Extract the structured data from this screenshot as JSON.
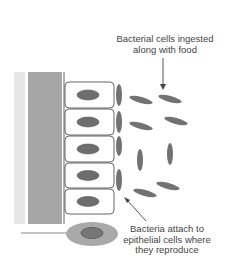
{
  "diagram": {
    "colors": {
      "background": "#ffffff",
      "lumen_strip_light": "#e6e6e6",
      "tissue_strip_dark": "#a6a6a6",
      "cell_outline": "#555555",
      "nucleus": "#6e6e6e",
      "bacterium": "#727272",
      "free_cell_body": "#a9a9a9",
      "free_cell_nucleus": "#777777",
      "arrow": "#444444",
      "text": "#444444"
    },
    "annotations": {
      "ingested": {
        "lines": [
          "Bacterial cells ingested",
          "along with food"
        ]
      },
      "attach": {
        "lines": [
          "Bacteria attach to",
          "epithelial cells where",
          "they reproduce"
        ]
      }
    },
    "epithelial_cells": [
      {
        "y": 82,
        "h": 26
      },
      {
        "y": 109,
        "h": 26
      },
      {
        "y": 136,
        "h": 26
      },
      {
        "y": 163,
        "h": 25
      },
      {
        "y": 189,
        "h": 25
      }
    ],
    "attached_bacteria": [
      {
        "cx": 119,
        "cy": 95,
        "rx": 3,
        "ry": 11
      },
      {
        "cx": 119,
        "cy": 122,
        "rx": 3,
        "ry": 11
      },
      {
        "cx": 119,
        "cy": 146,
        "rx": 3,
        "ry": 10
      },
      {
        "cx": 119,
        "cy": 180,
        "rx": 3,
        "ry": 11
      }
    ],
    "free_bacteria": [
      {
        "cx": 141,
        "cy": 100,
        "rx": 12,
        "ry": 3,
        "rot": 15
      },
      {
        "cx": 170,
        "cy": 99,
        "rx": 12,
        "ry": 3,
        "rot": 15
      },
      {
        "cx": 141,
        "cy": 126,
        "rx": 12,
        "ry": 3,
        "rot": 15
      },
      {
        "cx": 176,
        "cy": 121,
        "rx": 12,
        "ry": 3,
        "rot": 15
      },
      {
        "cx": 140,
        "cy": 160,
        "rx": 3,
        "ry": 11,
        "rot": 0
      },
      {
        "cx": 170,
        "cy": 154,
        "rx": 3,
        "ry": 11,
        "rot": 0
      },
      {
        "cx": 145,
        "cy": 193,
        "rx": 12,
        "ry": 3,
        "rot": 15
      },
      {
        "cx": 168,
        "cy": 186,
        "rx": 12,
        "ry": 3,
        "rot": 15
      }
    ]
  }
}
